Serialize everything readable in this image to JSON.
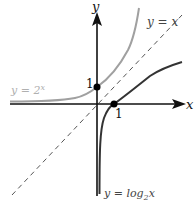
{
  "diagram": {
    "axes": {
      "x_label": "x",
      "y_label": "y",
      "origin_px": [
        97,
        104
      ],
      "unit_px": 17
    },
    "curves": [
      {
        "name": "exponential",
        "label": "y = 2",
        "label_sup": "x",
        "color": "#a0a0a0"
      },
      {
        "name": "logarithm",
        "label": "y = log",
        "label_sub": "2",
        "label_tail": "x",
        "color": "#333333"
      },
      {
        "name": "identity",
        "label": "y = x",
        "color": "#555555",
        "style": "dashed"
      }
    ],
    "points": [
      {
        "name": "y-intercept",
        "coords": [
          0,
          1
        ],
        "label": "1"
      },
      {
        "name": "x-intercept",
        "coords": [
          1,
          0
        ],
        "label": "1"
      }
    ],
    "colors": {
      "axis": "#111111",
      "exp_curve": "#a0a0a0",
      "log_curve": "#333333",
      "identity": "#555555",
      "exp_label": "#b0b0b0"
    }
  }
}
